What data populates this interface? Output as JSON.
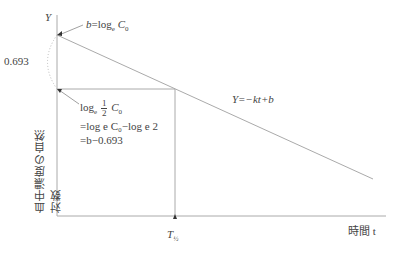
{
  "diagram": {
    "type": "semi-log elimination plot",
    "y_axis_label": "Y",
    "y_axis_title": "血中濃度の自然対数",
    "x_axis_title": "時間 t",
    "intercept_label": {
      "lhs": "b",
      "eq": "=log",
      "sub": "e",
      "var": "C",
      "varsub": "0"
    },
    "gap_label": "0.693",
    "half_label": {
      "line1_prefix": "log",
      "line1_sub": "e",
      "frac_num": "1",
      "frac_den": "2",
      "line1_var": "C",
      "line1_varsub": "0",
      "line2": "=log",
      "line2_rest": "e C₀−log",
      "line2_end": "e 2",
      "line3": "=b−0.693"
    },
    "line_equation": "Y=−kt+b",
    "x_marker_label": "T",
    "x_marker_sub": "½"
  }
}
